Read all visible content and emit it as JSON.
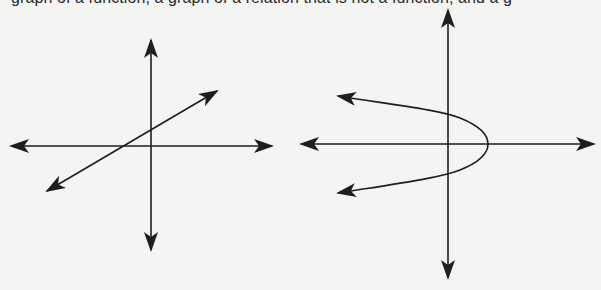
{
  "caption": {
    "text": "graph of a function, a graph of a relation that is not a function, and a g"
  },
  "figures": [
    {
      "id": "left",
      "description": "Graph of a linear function (straight line with positive slope) on coordinate axes",
      "axes": {
        "origin": [
          151,
          146
        ],
        "x_from": 11,
        "x_to": 272,
        "y_from": 40,
        "y_to": 250
      },
      "curve": {
        "type": "line",
        "from": [
          47,
          191
        ],
        "to": [
          217,
          91
        ]
      }
    },
    {
      "id": "right",
      "description": "Sideways parabola opening left (relation that is not a function) on coordinate axes",
      "axes": {
        "origin": [
          448,
          144
        ],
        "x_from": 301,
        "x_to": 594,
        "y_from": 10,
        "y_to": 278
      },
      "curve": {
        "type": "parabola",
        "vertex": [
          488,
          144
        ],
        "upper_end": [
          338,
          96
        ],
        "lower_end": [
          338,
          193
        ]
      }
    }
  ],
  "colors": {
    "ink": "#1e1e1e",
    "background": "#f4f4f3"
  }
}
